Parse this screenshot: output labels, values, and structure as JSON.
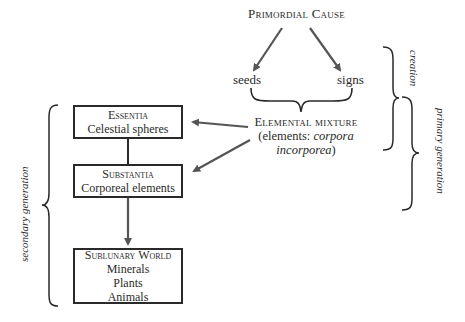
{
  "diagram": {
    "top_node": {
      "label": "Primordial Cause"
    },
    "branches": [
      {
        "label": "seeds"
      },
      {
        "label": "signs"
      }
    ],
    "mixture_node": {
      "title": "Elemental mixture",
      "subtitle_prefix": "(elements: ",
      "subtitle_italic_1": "corpora",
      "subtitle_italic_2": "incorporea",
      "subtitle_suffix": ")"
    },
    "boxes": [
      {
        "title": "Essentia",
        "lines": [
          "Celestial spheres"
        ]
      },
      {
        "title": "Substantia",
        "lines": [
          "Corporeal elements"
        ]
      },
      {
        "title": "Sublunary World",
        "lines": [
          "Minerals",
          "Plants",
          "Animals"
        ]
      }
    ],
    "brackets": {
      "creation": "creation",
      "primary_generation": "primary generation",
      "secondary_generation": "secondary generation"
    },
    "colors": {
      "line": "#2a2a2a",
      "arrow": "#555555",
      "text": "#2b2b2b"
    }
  }
}
